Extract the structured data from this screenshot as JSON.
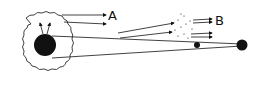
{
  "diagram": {
    "labels": {
      "a": "A",
      "b": "B"
    },
    "elements": {
      "cloud": "irregular-halo-cloud",
      "large_body": "large-black-sphere",
      "small_body": "small-black-dot",
      "distant_body": "distant-black-sphere",
      "arrows_a": 2,
      "arrows_b": 4,
      "arrows_up": 2
    },
    "colors": {
      "ink": "#111111",
      "background": "#ffffff"
    }
  }
}
